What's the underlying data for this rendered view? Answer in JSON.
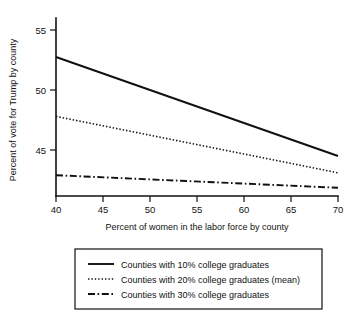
{
  "chart_data": {
    "type": "line",
    "title": "",
    "xlabel": "Percent of women in the labor force by county",
    "ylabel": "Percent of vote for Trump by county",
    "xlim": [
      40,
      70
    ],
    "ylim": [
      41.2,
      56.3
    ],
    "xticks": [
      "40",
      "45",
      "50",
      "55",
      "60",
      "65",
      "70"
    ],
    "xtick_values": [
      40,
      45,
      50,
      55,
      60,
      65,
      70
    ],
    "yticks": [
      "55",
      "50",
      "45"
    ],
    "ytick_values": [
      55,
      50,
      45
    ],
    "grid": false,
    "legend_position": "below-plot",
    "x": [
      40,
      70
    ],
    "series": [
      {
        "name": "Counties with 10% college graduates",
        "style": "solid",
        "values": [
          52.75,
          44.5
        ]
      },
      {
        "name": "Counties with 20% college graduates (mean)",
        "style": "dotted",
        "values": [
          47.8,
          43.1
        ]
      },
      {
        "name": "Counties with 30% college graduates",
        "style": "dash-dot",
        "values": [
          42.9,
          41.85
        ]
      }
    ]
  },
  "legend": {
    "entries": [
      {
        "label": "Counties with 10% college graduates",
        "style": "solid"
      },
      {
        "label": "Counties with 20% college graduates (mean)",
        "style": "dotted"
      },
      {
        "label": "Counties with 30% college graduates",
        "style": "dash-dot"
      }
    ]
  },
  "axes": {
    "x_title": "Percent of women in the labor force by county",
    "y_title": "Percent of vote for Trump by county",
    "x_tick_labels": [
      "40",
      "45",
      "50",
      "55",
      "60",
      "65",
      "70"
    ],
    "y_tick_labels": [
      "55",
      "50",
      "45"
    ]
  },
  "colors": {
    "ink": "#111111",
    "background": "#ffffff"
  }
}
